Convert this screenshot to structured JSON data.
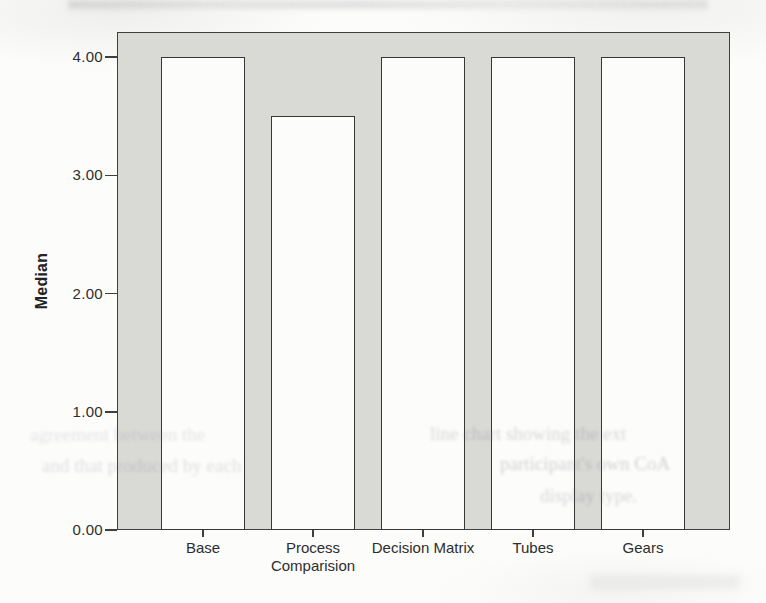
{
  "figure": {
    "y_axis_title": "Median"
  },
  "chart_data": {
    "type": "bar",
    "categories": [
      "Base",
      "Process Comparision",
      "Decision Matrix",
      "Tubes",
      "Gears"
    ],
    "category_lines": [
      [
        "Base"
      ],
      [
        "Process",
        "Comparision"
      ],
      [
        "Decision Matrix"
      ],
      [
        "Tubes"
      ],
      [
        "Gears"
      ]
    ],
    "values": [
      4.0,
      3.5,
      4.0,
      4.0,
      4.0
    ],
    "title": "",
    "xlabel": "",
    "ylabel": "Median",
    "ylim": [
      0,
      4.2
    ],
    "y_tick_labels": [
      "0.00",
      "1.00",
      "2.00",
      "3.00",
      "4.00"
    ],
    "y_tick_values": [
      0,
      1,
      2,
      3,
      4
    ],
    "grid": false,
    "legend": "none",
    "plot_background_color": "#d9d9d6",
    "bar_fill_color": "#fcfcfa",
    "bar_border_color": "#373737",
    "axis_color": "#3f3f3f"
  },
  "scan_artifacts": {
    "bleed_fragments": [
      {
        "text": "agreement between the",
        "x": 30,
        "y": 424,
        "opacity": 0.2
      },
      {
        "text": "line chart showing the ext",
        "x": 430,
        "y": 423,
        "opacity": 0.3
      },
      {
        "text": "and that produced by each",
        "x": 42,
        "y": 455,
        "opacity": 0.24
      },
      {
        "text": "participant's own CoA",
        "x": 500,
        "y": 453,
        "opacity": 0.34
      },
      {
        "text": "display type.",
        "x": 540,
        "y": 485,
        "opacity": 0.3
      }
    ]
  }
}
